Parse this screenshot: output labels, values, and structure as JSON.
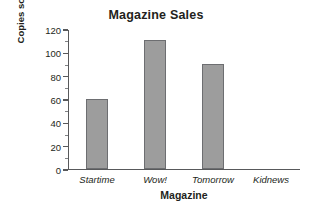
{
  "chart_data": {
    "type": "bar",
    "title": "Magazine Sales",
    "xlabel": "Magazine",
    "ylabel": "Copies sold (thousands)",
    "categories": [
      "Startime",
      "Wow!",
      "Tomorrow",
      "Kidnews"
    ],
    "values": [
      60,
      110,
      90,
      0
    ],
    "ylim": [
      0,
      120
    ],
    "ytick_labels": [
      "0",
      "20",
      "40",
      "60",
      "80",
      "100",
      "120"
    ],
    "ytick_values": [
      0,
      20,
      40,
      60,
      80,
      100,
      120
    ],
    "minor_tick_step": 10,
    "grid": false,
    "legend": null,
    "bar_color": "#9d9d9d",
    "bar_border_color": "#6d6e71",
    "axis_color": "#58595b",
    "text_color": "#231f20"
  }
}
